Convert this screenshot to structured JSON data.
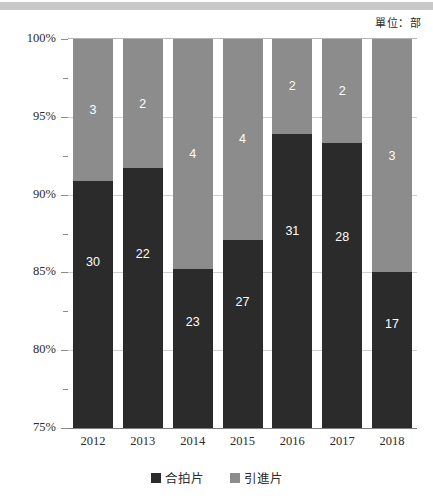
{
  "decor": {
    "top_band": true
  },
  "unit_note": "單位：部",
  "legend": [
    {
      "label": "合拍片",
      "color": "#2b2b2b",
      "key": "co_production"
    },
    {
      "label": "引進片",
      "color": "#8c8c8c",
      "key": "imported"
    }
  ],
  "chart_data": {
    "type": "bar",
    "stacked": true,
    "stacked_mode": "percent",
    "title": "",
    "subtitle": "",
    "xlabel": "",
    "ylabel": "",
    "annotation": "單位：部",
    "categories": [
      "2012",
      "2013",
      "2014",
      "2015",
      "2016",
      "2017",
      "2018"
    ],
    "series": [
      {
        "name": "合拍片",
        "color": "#2b2b2b",
        "values": [
          30,
          22,
          23,
          27,
          31,
          28,
          17
        ],
        "percent": [
          90.9,
          91.7,
          85.2,
          87.1,
          93.9,
          93.3,
          85.0
        ]
      },
      {
        "name": "引進片",
        "color": "#8c8c8c",
        "values": [
          3,
          2,
          4,
          4,
          2,
          2,
          3
        ],
        "percent": [
          9.1,
          8.3,
          14.8,
          12.9,
          6.1,
          6.7,
          15.0
        ]
      }
    ],
    "totals": [
      33,
      24,
      27,
      31,
      33,
      30,
      20
    ],
    "ylim": [
      75,
      100
    ],
    "yticks": [
      "75%",
      "80%",
      "85%",
      "90%",
      "95%",
      "100%"
    ],
    "ytick_values": [
      75,
      80,
      85,
      90,
      95,
      100
    ],
    "yminor_values": [
      77.5,
      82.5,
      87.5,
      92.5,
      97.5
    ],
    "grid": true,
    "legend_position": "bottom"
  }
}
